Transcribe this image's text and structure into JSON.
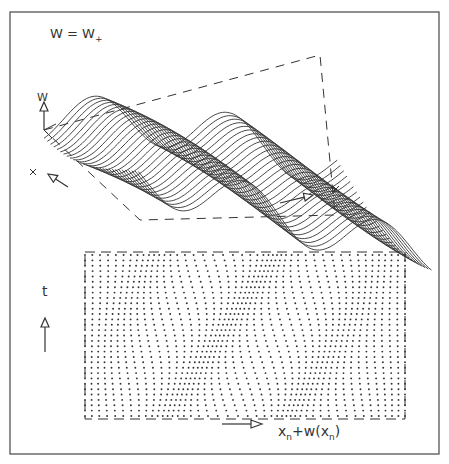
{
  "figure": {
    "frame": {
      "x": 10,
      "y": 12,
      "width": 429,
      "height": 442,
      "stroke": "#555555"
    },
    "ink": "#333333",
    "top_panel": {
      "title": "W = W",
      "title_subscript": "+",
      "axis_label_w": "W",
      "surface": {
        "lines": 30,
        "origin": [
          44,
          120
        ],
        "step_x": [
          2.55,
          0.62
        ],
        "step_y": [
          3.25,
          2.55
        ],
        "samples": 110,
        "width_units": 115,
        "depth_units": 29,
        "amplitude": 26,
        "wave_freq": 2.2,
        "tilt": -34
      },
      "box": {
        "corners": [
          [
            44,
            130
          ],
          [
            320,
            55
          ],
          [
            335,
            215
          ],
          [
            140,
            220
          ]
        ]
      },
      "arrows": {
        "w_axis": {
          "x": 44,
          "y1": 130,
          "y2": 102
        },
        "left_arrow": {
          "from": [
            68,
            187
          ],
          "to": [
            48,
            174
          ]
        },
        "right_arrow": {
          "from": [
            280,
            203
          ],
          "to": [
            313,
            195
          ]
        }
      },
      "tick_marks": [
        [
          33,
          172
        ],
        [
          336,
          189
        ]
      ]
    },
    "bottom_panel": {
      "t_label": "t",
      "x_label_main": "x",
      "x_label_sub": "n",
      "x_label_rest": "+w(x",
      "x_label_sub2": "n",
      "x_label_close": ")",
      "lattice": {
        "left": 85,
        "right": 405,
        "top": 255,
        "bottom": 416,
        "cols": 46,
        "rows": 31,
        "dot_radius": 0.95,
        "wave_amplitude": 9,
        "wave_periods": 2.5
      },
      "t_arrow": {
        "x": 45,
        "y1": 352,
        "y2": 318
      },
      "x_arrow": {
        "x1": 222,
        "x2": 262,
        "y": 424
      }
    }
  }
}
